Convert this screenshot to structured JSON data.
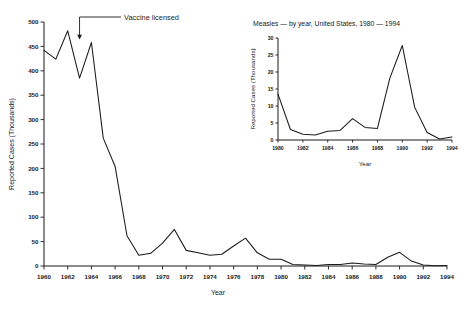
{
  "chart_data": [
    {
      "id": "main",
      "type": "line",
      "title": "",
      "xlabel": "Year",
      "ylabel": "Reported Cases (Thousands)",
      "xlim": [
        1960,
        1994
      ],
      "ylim": [
        0,
        500
      ],
      "ytick_step": 50,
      "xtick_step": 2,
      "grid": false,
      "legend": "none",
      "yticks": [
        0,
        50,
        100,
        150,
        200,
        250,
        300,
        350,
        400,
        450,
        500
      ],
      "xticks": [
        1960,
        1962,
        1964,
        1966,
        1968,
        1970,
        1972,
        1974,
        1976,
        1978,
        1980,
        1982,
        1984,
        1986,
        1988,
        1990,
        1992,
        1994
      ],
      "x": [
        1960,
        1961,
        1962,
        1963,
        1964,
        1965,
        1966,
        1967,
        1968,
        1969,
        1970,
        1971,
        1972,
        1973,
        1974,
        1975,
        1976,
        1977,
        1978,
        1979,
        1980,
        1981,
        1982,
        1983,
        1984,
        1985,
        1986,
        1987,
        1988,
        1989,
        1990,
        1991,
        1992,
        1993,
        1994
      ],
      "values": [
        442,
        424,
        482,
        385,
        458,
        262,
        204,
        62,
        22,
        26,
        47,
        75,
        32,
        27,
        22,
        24,
        41,
        57,
        27,
        14,
        14,
        3,
        2,
        1,
        3,
        3,
        6,
        4,
        3,
        18,
        28,
        10,
        2,
        0.3,
        1
      ],
      "annotations": [
        {
          "label": "Vaccine licensed",
          "x_year": 1963,
          "kind": "arrow-elbow-down"
        }
      ]
    },
    {
      "id": "inset",
      "type": "line",
      "title": "Measles — by year, United States, 1980 — 1994",
      "xlabel": "Year",
      "ylabel": "Reported Cases (Thousands)",
      "xlim": [
        1980,
        1994
      ],
      "ylim": [
        0,
        30
      ],
      "ytick_step": 5,
      "xtick_step": 2,
      "grid": false,
      "legend": "none",
      "yticks": [
        0,
        5,
        10,
        15,
        20,
        25,
        30
      ],
      "xticks": [
        1980,
        1982,
        1984,
        1986,
        1988,
        1990,
        1992,
        1994
      ],
      "x": [
        1980,
        1981,
        1982,
        1983,
        1984,
        1985,
        1986,
        1987,
        1988,
        1989,
        1990,
        1991,
        1992,
        1993,
        1994
      ],
      "values": [
        13.5,
        3.1,
        1.7,
        1.5,
        2.6,
        2.8,
        6.3,
        3.7,
        3.4,
        18.2,
        27.8,
        9.6,
        2.2,
        0.3,
        0.9
      ]
    }
  ],
  "colors": {
    "ink": "#1a1a1a",
    "background": "#ffffff",
    "series": "#1a1a1a"
  },
  "main": {
    "xlabel": "Year",
    "ylabel": "Reported Cases (Thousands)",
    "annotation_label": "Vaccine licensed",
    "yticks": [
      "0",
      "50",
      "100",
      "150",
      "200",
      "250",
      "300",
      "350",
      "400",
      "450",
      "500"
    ],
    "xticks": [
      "1960",
      "1962",
      "1964",
      "1966",
      "1968",
      "1970",
      "1972",
      "1974",
      "1976",
      "1978",
      "1980",
      "1982",
      "1984",
      "1986",
      "1988",
      "1990",
      "1992",
      "1994"
    ]
  },
  "inset": {
    "title": "Measles — by year, United States, 1980 — 1994",
    "xlabel": "Year",
    "ylabel": "Reported Cases (Thousands)",
    "yticks": [
      "0",
      "5",
      "10",
      "15",
      "20",
      "25",
      "30"
    ],
    "xticks": [
      "1980",
      "1982",
      "1984",
      "1986",
      "1988",
      "1990",
      "1992",
      "1994"
    ]
  }
}
